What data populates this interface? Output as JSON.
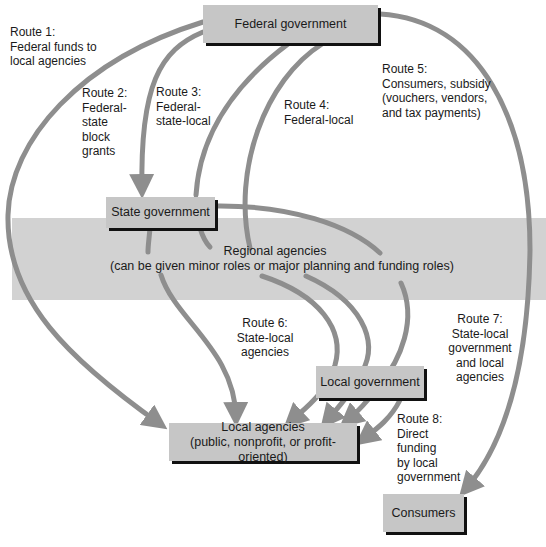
{
  "diagram": {
    "colors": {
      "box_fill": "#c6c6c6",
      "box_shadow": "#111111",
      "band_fill": "#d2d2d2",
      "arrow": "#8e8e8e",
      "text": "#1a1a1a",
      "background": "#ffffff"
    },
    "nodes": {
      "federal": {
        "label": "Federal government"
      },
      "state": {
        "label": "State government"
      },
      "regional": {
        "title": "Regional agencies",
        "subtitle": "(can be given minor roles or major planning and funding roles)"
      },
      "local_gov": {
        "label": "Local government"
      },
      "local_agencies": {
        "title": "Local agencies",
        "subtitle": "(public, nonprofit, or profit-oriented)"
      },
      "consumers": {
        "label": "Consumers"
      }
    },
    "routes": [
      {
        "id": "route-1",
        "lines": [
          "Route 1:",
          "Federal funds to",
          "local agencies"
        ],
        "from": "Federal government",
        "to": "Local agencies"
      },
      {
        "id": "route-2",
        "lines": [
          "Route 2:",
          "Federal-",
          "state",
          "block",
          "grants"
        ],
        "from": "Federal government",
        "to": "State government"
      },
      {
        "id": "route-3",
        "lines": [
          "Route 3:",
          "Federal-",
          "state-local"
        ],
        "from": "Federal government",
        "to": "Local agencies"
      },
      {
        "id": "route-4",
        "lines": [
          "Route 4:",
          "Federal-local"
        ],
        "from": "Federal government",
        "to": "Local agencies"
      },
      {
        "id": "route-5",
        "lines": [
          "Route 5:",
          "Consumers, subsidy",
          "(vouchers, vendors,",
          "and tax payments)"
        ],
        "from": "Federal government",
        "to": "Consumers"
      },
      {
        "id": "route-6",
        "lines": [
          "Route 6:",
          "State-local",
          "agencies"
        ],
        "from": "State government",
        "to": "Local agencies"
      },
      {
        "id": "route-7",
        "lines": [
          "Route 7:",
          "State-local",
          "government",
          "and local",
          "agencies"
        ],
        "from": "State government",
        "to": "Local agencies"
      },
      {
        "id": "route-8",
        "lines": [
          "Route 8:",
          "Direct",
          "funding",
          "by local",
          "government"
        ],
        "from": "Local government",
        "to": "Local agencies"
      }
    ]
  }
}
